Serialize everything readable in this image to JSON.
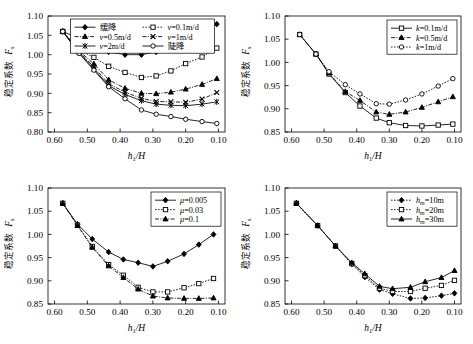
{
  "figure": {
    "panel_count": 4,
    "axis": {
      "y_label_cn": "稳定系数",
      "y_label_sym": "F",
      "y_label_sub": "s",
      "x_label_sym": "h",
      "x_label_sub": "1",
      "x_label_rest": "/H"
    }
  },
  "chart_data": [
    {
      "type": "line",
      "panel": "top-left",
      "title": "",
      "xlabel": "h1/H",
      "ylabel": "稳定系数 Fs",
      "xlim": [
        0.62,
        0.08
      ],
      "ylim": [
        0.8,
        1.1
      ],
      "x_ticks": [
        "0.60",
        "0.50",
        "0.40",
        "0.30",
        "0.20",
        "0.10"
      ],
      "x_tick_values": [
        0.6,
        0.5,
        0.4,
        0.3,
        0.2,
        0.1
      ],
      "y_ticks": [
        "0.80",
        "0.85",
        "0.90",
        "0.95",
        "1.00",
        "1.05",
        "1.10"
      ],
      "y_tick_values": [
        0.8,
        0.85,
        0.9,
        0.95,
        1.0,
        1.05,
        1.1
      ],
      "grid": false,
      "legend_position": "top-center",
      "legend_columns": 2,
      "x": [
        0.575,
        0.525,
        0.48,
        0.435,
        0.385,
        0.335,
        0.29,
        0.245,
        0.2,
        0.15,
        0.105
      ],
      "series": [
        {
          "name": "缓降",
          "marker": "diamond",
          "line": "solid",
          "values": [
            1.06,
            1.042,
            1.022,
            1.007,
            1.0,
            1.0,
            1.007,
            1.021,
            1.035,
            1.055,
            1.079
          ]
        },
        {
          "name": "v=0.1m/d",
          "marker": "square",
          "line": "dotted",
          "values": [
            1.06,
            1.012,
            0.993,
            0.97,
            0.954,
            0.941,
            0.945,
            0.958,
            0.977,
            0.994,
            1.017
          ]
        },
        {
          "name": "v=0.5m/d",
          "marker": "triangle",
          "line": "dashdot",
          "values": [
            1.06,
            1.01,
            0.976,
            0.935,
            0.913,
            0.9,
            0.899,
            0.903,
            0.911,
            0.923,
            0.938
          ]
        },
        {
          "name": "v=1m/d",
          "marker": "cross",
          "line": "dashdot",
          "values": [
            1.06,
            1.008,
            0.968,
            0.925,
            0.903,
            0.887,
            0.879,
            0.878,
            0.877,
            0.885,
            0.902
          ]
        },
        {
          "name": "v=2m/d",
          "marker": "star",
          "line": "solid",
          "values": [
            1.06,
            1.006,
            0.963,
            0.92,
            0.897,
            0.881,
            0.872,
            0.869,
            0.868,
            0.872,
            0.878
          ]
        },
        {
          "name": "陡降",
          "marker": "circle",
          "line": "solid",
          "values": [
            1.06,
            1.003,
            0.96,
            0.917,
            0.886,
            0.857,
            0.846,
            0.84,
            0.833,
            0.827,
            0.822
          ]
        }
      ]
    },
    {
      "type": "line",
      "panel": "top-right",
      "title": "",
      "xlabel": "h1/H",
      "ylabel": "稳定系数 Fs",
      "xlim": [
        0.62,
        0.08
      ],
      "ylim": [
        0.85,
        1.1
      ],
      "x_ticks": [
        "0.60",
        "0.50",
        "0.40",
        "0.30",
        "0.20",
        "0.10"
      ],
      "x_tick_values": [
        0.6,
        0.5,
        0.4,
        0.3,
        0.2,
        0.1
      ],
      "y_ticks": [
        "0.85",
        "0.90",
        "0.95",
        "1.00",
        "1.05",
        "1.10"
      ],
      "y_tick_values": [
        0.85,
        0.9,
        0.95,
        1.0,
        1.05,
        1.1
      ],
      "grid": false,
      "legend_position": "top-right",
      "legend_columns": 1,
      "x": [
        0.575,
        0.525,
        0.485,
        0.435,
        0.39,
        0.34,
        0.3,
        0.25,
        0.2,
        0.15,
        0.105
      ],
      "series": [
        {
          "name": "k=0.1m/d",
          "marker": "square",
          "line": "solid",
          "values": [
            1.06,
            1.018,
            0.975,
            0.935,
            0.906,
            0.88,
            0.87,
            0.864,
            0.863,
            0.865,
            0.867
          ]
        },
        {
          "name": "k=0.5m/d",
          "marker": "triangle",
          "line": "dashdot",
          "values": [
            1.06,
            1.018,
            0.977,
            0.937,
            0.918,
            0.893,
            0.888,
            0.893,
            0.903,
            0.915,
            0.926
          ]
        },
        {
          "name": "k=1m/d",
          "marker": "circle",
          "line": "dotted",
          "values": [
            1.06,
            1.018,
            0.98,
            0.952,
            0.932,
            0.911,
            0.91,
            0.919,
            0.932,
            0.949,
            0.965
          ]
        }
      ]
    },
    {
      "type": "line",
      "panel": "bottom-left",
      "title": "",
      "xlabel": "h1/H",
      "ylabel": "稳定系数 Fs",
      "xlim": [
        0.62,
        0.08
      ],
      "ylim": [
        0.85,
        1.1
      ],
      "x_ticks": [
        "0.60",
        "0.50",
        "0.40",
        "0.30",
        "0.20",
        "0.10"
      ],
      "x_tick_values": [
        0.6,
        0.5,
        0.4,
        0.3,
        0.2,
        0.1
      ],
      "y_ticks": [
        "0.85",
        "0.90",
        "0.95",
        "1.00",
        "1.05",
        "1.10"
      ],
      "y_tick_values": [
        0.85,
        0.9,
        0.95,
        1.0,
        1.05,
        1.1
      ],
      "grid": false,
      "legend_position": "top-right",
      "legend_columns": 1,
      "x": [
        0.575,
        0.53,
        0.485,
        0.435,
        0.39,
        0.345,
        0.3,
        0.255,
        0.205,
        0.16,
        0.115
      ],
      "series": [
        {
          "name": "μ=0.005",
          "marker": "diamond",
          "line": "solid",
          "values": [
            1.067,
            1.022,
            0.99,
            0.962,
            0.946,
            0.939,
            0.931,
            0.942,
            0.958,
            0.978,
            1.0
          ]
        },
        {
          "name": "μ=0.03",
          "marker": "square",
          "line": "dotted",
          "values": [
            1.067,
            1.02,
            0.974,
            0.935,
            0.912,
            0.886,
            0.876,
            0.876,
            0.885,
            0.894,
            0.905
          ]
        },
        {
          "name": "μ=0.1",
          "marker": "triangle",
          "line": "dashdot",
          "values": [
            1.067,
            1.019,
            0.972,
            0.932,
            0.907,
            0.882,
            0.867,
            0.863,
            0.862,
            0.862,
            0.863
          ]
        }
      ]
    },
    {
      "type": "line",
      "panel": "bottom-right",
      "title": "",
      "xlabel": "h1/H",
      "ylabel": "稳定系数 Fs",
      "xlim": [
        0.62,
        0.08
      ],
      "ylim": [
        0.85,
        1.1
      ],
      "x_ticks": [
        "0.60",
        "0.50",
        "0.40",
        "0.30",
        "0.20",
        "0.10"
      ],
      "x_tick_values": [
        0.6,
        0.5,
        0.4,
        0.3,
        0.2,
        0.1
      ],
      "y_ticks": [
        "0.85",
        "0.90",
        "0.95",
        "1.00",
        "1.05",
        "1.10"
      ],
      "y_tick_values": [
        0.85,
        0.9,
        0.95,
        1.0,
        1.05,
        1.1
      ],
      "grid": false,
      "legend_position": "top-right",
      "legend_columns": 1,
      "x": [
        0.585,
        0.52,
        0.465,
        0.415,
        0.375,
        0.33,
        0.29,
        0.235,
        0.19,
        0.14,
        0.1
      ],
      "series": [
        {
          "name": "hm=10m",
          "marker": "diamond",
          "line": "dotted",
          "values": [
            1.067,
            1.019,
            0.975,
            0.936,
            0.908,
            0.881,
            0.872,
            0.862,
            0.863,
            0.868,
            0.873
          ]
        },
        {
          "name": "hm=20m",
          "marker": "square",
          "line": "dotted",
          "values": [
            1.067,
            1.019,
            0.975,
            0.937,
            0.911,
            0.884,
            0.877,
            0.877,
            0.884,
            0.89,
            0.901
          ]
        },
        {
          "name": "hm=30m",
          "marker": "triangle",
          "line": "solid",
          "values": [
            1.067,
            1.019,
            0.975,
            0.939,
            0.915,
            0.888,
            0.883,
            0.886,
            0.898,
            0.907,
            0.922
          ]
        }
      ]
    }
  ]
}
